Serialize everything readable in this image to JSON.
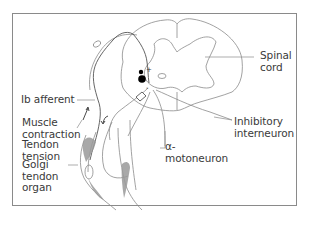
{
  "figure": {
    "type": "anatomical-diagram",
    "labels": {
      "spinal_cord": "Spinal\ncord",
      "ib_afferent": "Ib afferent",
      "muscle_contraction": "Muscle\ncontraction",
      "tendon_tension": "Tendon\ntension",
      "golgi_tendon_organ": "Golgi\ntendon\norgan",
      "inhibitory_interneuron": "Inhibitory\ninterneuron",
      "alpha_motoneuron": "α-\nmotoneuron"
    },
    "synapse_signs": {
      "excitatory": "+",
      "inhibitory": "-"
    },
    "colors": {
      "line": "#8a8a8a",
      "dark_line": "#555555",
      "neuron": "#000000",
      "muscle_shade": "#9a9a9a",
      "text": "#3a3a3a"
    }
  }
}
